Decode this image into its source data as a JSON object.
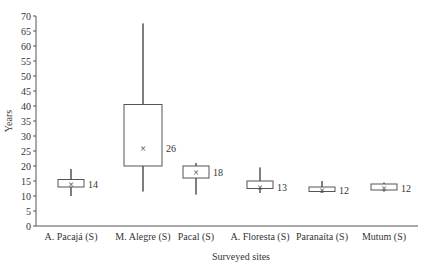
{
  "chart_data": {
    "type": "box",
    "title": "",
    "xlabel": "Surveyed sites",
    "ylabel": "Years",
    "ylim": [
      0,
      70
    ],
    "yticks": [
      0,
      5,
      10,
      15,
      20,
      25,
      30,
      35,
      40,
      45,
      50,
      55,
      60,
      65,
      70
    ],
    "grid": false,
    "categories": [
      "A. Pacajá (S)",
      "M. Alegre (S)",
      "Pacal (S)",
      "A. Floresta (S)",
      "Paranaíta (S)",
      "Mutum (S)"
    ],
    "boxes": [
      {
        "site": "A. Pacajá (S)",
        "whisker_low": 10,
        "q1": 13,
        "q3": 15.5,
        "whisker_high": 19,
        "mean": 14,
        "label": "14"
      },
      {
        "site": "M. Alegre (S)",
        "whisker_low": 11.5,
        "q1": 20,
        "q3": 40.5,
        "whisker_high": 67.5,
        "mean": 26,
        "label": "26"
      },
      {
        "site": "Pacal (S)",
        "whisker_low": 10.5,
        "q1": 16,
        "q3": 20,
        "whisker_high": 21,
        "mean": 18,
        "label": "18"
      },
      {
        "site": "A. Floresta (S)",
        "whisker_low": 11,
        "q1": 12.5,
        "q3": 15,
        "whisker_high": 19.5,
        "mean": 13,
        "label": "13"
      },
      {
        "site": "Paranaíta (S)",
        "whisker_low": 11,
        "q1": 11.5,
        "q3": 13,
        "whisker_high": 15,
        "mean": 12,
        "label": "12"
      },
      {
        "site": "Mutum (S)",
        "whisker_low": 11.5,
        "q1": 12,
        "q3": 14,
        "whisker_high": 14.5,
        "mean": 12.5,
        "label": "12"
      }
    ],
    "mean_marker": "×"
  }
}
